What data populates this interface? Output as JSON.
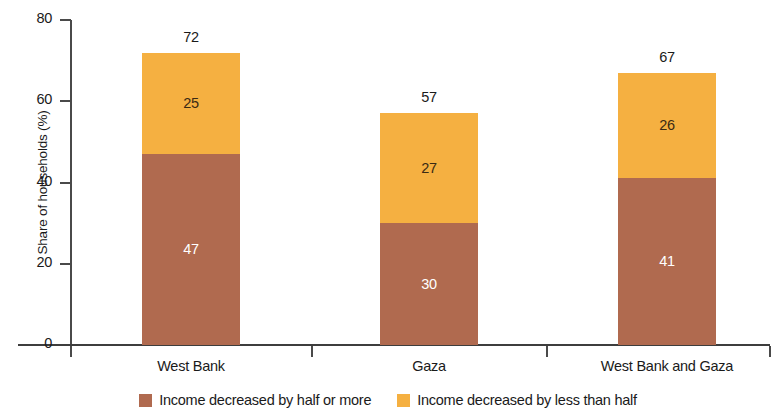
{
  "chart_data": {
    "type": "bar",
    "subtype": "stacked-vertical",
    "title": "",
    "subtitle": "",
    "xlabel": "",
    "ylabel": "Share of households (%)",
    "ylim": [
      0,
      80
    ],
    "yticks": [
      0,
      20,
      40,
      60,
      80
    ],
    "ytick_labels": [
      "0",
      "20",
      "40",
      "60",
      "80"
    ],
    "grid": false,
    "legend_position": "bottom",
    "categories": [
      "West Bank",
      "Gaza",
      "West Bank and Gaza"
    ],
    "series": [
      {
        "name": "Income decreased by half or more",
        "color": "#b06a4f",
        "label_color": "#ffffff",
        "values": [
          47,
          30,
          41
        ],
        "value_labels": [
          "47",
          "30",
          "41"
        ]
      },
      {
        "name": "Income decreased by less than half",
        "color": "#f5b041",
        "label_color": "#3a2a14",
        "values": [
          25,
          27,
          26
        ],
        "value_labels": [
          "25",
          "27",
          "26"
        ]
      }
    ],
    "totals": [
      72,
      57,
      67
    ],
    "total_labels": [
      "72",
      "57",
      "67"
    ],
    "axis_color": "#4a4a4a",
    "background": "#ffffff"
  },
  "legend": {
    "items": [
      {
        "label": "Income decreased by half or more",
        "color": "#b06a4f"
      },
      {
        "label": "Income decreased by less than half",
        "color": "#f5b041"
      }
    ]
  }
}
